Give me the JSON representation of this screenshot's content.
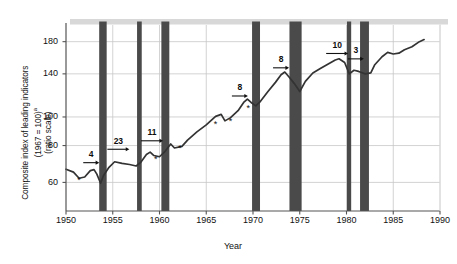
{
  "chart_data": {
    "type": "line",
    "title": "",
    "xlabel": "Year",
    "ylabel_lines": [
      "Composite index of leading indicators",
      "(1967 = 100)a",
      "(ratio scale)"
    ],
    "ylabel_main": "Composite index of leading indicators",
    "ylabel_note": "(1967 = 100)",
    "ylabel_superscript": "a",
    "ylabel_scale": "(ratio scale)",
    "scale": "log",
    "xlim": [
      1950,
      1990
    ],
    "ylim": [
      48,
      205
    ],
    "xticks": [
      1950,
      1955,
      1960,
      1965,
      1970,
      1975,
      1980,
      1985,
      1990
    ],
    "xtick_labels": [
      "1950",
      "1955",
      "1960",
      "1965",
      "1970",
      "1975",
      "1980",
      "1985",
      "1990"
    ],
    "yticks": [
      60,
      80,
      100,
      140,
      180
    ],
    "ytick_labels": [
      "60",
      "80",
      "100",
      "140",
      "180"
    ],
    "grid": true,
    "legend": "none",
    "series": [
      {
        "name": "Composite index of leading indicators",
        "color": "#333333",
        "points": [
          [
            1950.0,
            66.5
          ],
          [
            1950.8,
            65.0
          ],
          [
            1951.4,
            62.0
          ],
          [
            1952.0,
            62.6
          ],
          [
            1952.6,
            65.8
          ],
          [
            1953.0,
            66.3
          ],
          [
            1953.3,
            64.0
          ],
          [
            1953.7,
            59.6
          ],
          [
            1954.0,
            63.2
          ],
          [
            1954.6,
            67.5
          ],
          [
            1955.2,
            70.5
          ],
          [
            1956.0,
            69.6
          ],
          [
            1956.8,
            69.0
          ],
          [
            1957.5,
            68.2
          ],
          [
            1958.0,
            70.2
          ],
          [
            1958.6,
            74.6
          ],
          [
            1959.0,
            76.0
          ],
          [
            1959.4,
            74.0
          ],
          [
            1960.0,
            73.3
          ],
          [
            1960.6,
            76.5
          ],
          [
            1961.2,
            81.0
          ],
          [
            1961.6,
            78.5
          ],
          [
            1962.4,
            79.5
          ],
          [
            1963.0,
            83.5
          ],
          [
            1964.0,
            89.0
          ],
          [
            1965.0,
            94.0
          ],
          [
            1966.0,
            100.5
          ],
          [
            1966.6,
            102.0
          ],
          [
            1967.0,
            97.0
          ],
          [
            1967.6,
            99.5
          ],
          [
            1968.4,
            105.0
          ],
          [
            1969.0,
            112.0
          ],
          [
            1969.4,
            115.0
          ],
          [
            1969.8,
            112.0
          ],
          [
            1970.3,
            109.0
          ],
          [
            1970.8,
            113.0
          ],
          [
            1971.6,
            122.0
          ],
          [
            1972.4,
            131.0
          ],
          [
            1973.0,
            139.0
          ],
          [
            1973.4,
            142.0
          ],
          [
            1973.9,
            136.0
          ],
          [
            1974.4,
            130.0
          ],
          [
            1975.0,
            122.0
          ],
          [
            1975.6,
            132.0
          ],
          [
            1976.4,
            141.0
          ],
          [
            1977.2,
            146.0
          ],
          [
            1978.0,
            151.0
          ],
          [
            1978.8,
            156.0
          ],
          [
            1979.2,
            157.5
          ],
          [
            1979.8,
            153.0
          ],
          [
            1980.3,
            140.0
          ],
          [
            1980.8,
            144.0
          ],
          [
            1981.2,
            143.0
          ],
          [
            1981.6,
            141.5
          ],
          [
            1982.0,
            140.0
          ],
          [
            1982.6,
            141.0
          ],
          [
            1983.0,
            150.0
          ],
          [
            1983.8,
            160.0
          ],
          [
            1984.4,
            165.5
          ],
          [
            1985.0,
            163.5
          ],
          [
            1985.6,
            164.5
          ],
          [
            1986.2,
            169.0
          ],
          [
            1987.0,
            173.0
          ],
          [
            1987.8,
            180.0
          ],
          [
            1988.3,
            183.0
          ]
        ]
      }
    ],
    "recessions": [
      {
        "label": "1953-54",
        "start": 1953.55,
        "end": 1954.35
      },
      {
        "label": "1957-58",
        "start": 1957.6,
        "end": 1958.1
      },
      {
        "label": "1960-61",
        "start": 1960.2,
        "end": 1961.05
      },
      {
        "label": "1969-70",
        "start": 1969.9,
        "end": 1970.75
      },
      {
        "label": "1973-75",
        "start": 1973.9,
        "end": 1975.2
      },
      {
        "label": "1980",
        "start": 1980.05,
        "end": 1980.5
      },
      {
        "label": "1981-82",
        "start": 1981.45,
        "end": 1982.4
      }
    ],
    "recession_color": "#4a4a4a",
    "lead_time_annotations": [
      {
        "text": "4",
        "x": 1952.7,
        "y": 72.5
      },
      {
        "text": "23",
        "x": 1955.6,
        "y": 80.5
      },
      {
        "text": "11",
        "x": 1959.2,
        "y": 86.0
      },
      {
        "text": "8",
        "x": 1968.6,
        "y": 122.0
      },
      {
        "text": "8",
        "x": 1973.0,
        "y": 152.0
      },
      {
        "text": "10",
        "x": 1979.0,
        "y": 170.0
      },
      {
        "text": "3",
        "x": 1981.0,
        "y": 163.0
      }
    ],
    "peak_markers": [
      {
        "x": 1951.4,
        "y": 59.5
      },
      {
        "x": 1959.6,
        "y": 70.5
      },
      {
        "x": 1962.2,
        "y": 76.5
      },
      {
        "x": 1966.0,
        "y": 92.5
      },
      {
        "x": 1967.6,
        "y": 95.0
      },
      {
        "x": 1969.5,
        "y": 105.0
      }
    ],
    "marker_symbol": "*",
    "top_band": true,
    "colors": {
      "line": "#333333",
      "recession_bar": "#4a4a4a",
      "grid": "#c8c8c8",
      "axis": "#555555",
      "text": "#111111",
      "top_band": "#d8d8d8"
    }
  }
}
